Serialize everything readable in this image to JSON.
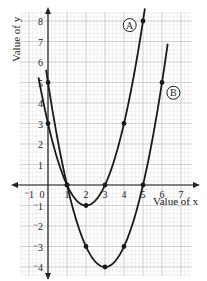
{
  "chart_data": {
    "type": "line",
    "title": "",
    "xlabel": "Value of x",
    "ylabel": "Value of y",
    "xlim": [
      -1.5,
      7.5
    ],
    "ylim": [
      -4.3,
      8.5
    ],
    "grid": true,
    "x_ticks": [
      -1,
      0,
      1,
      2,
      3,
      4,
      5,
      6,
      7
    ],
    "x_tick_labels": [
      "⁻1",
      "0",
      "1",
      "2",
      "3",
      "4",
      "5",
      "6",
      "7"
    ],
    "y_ticks": [
      8,
      7,
      6,
      5,
      4,
      3,
      2,
      1,
      -1,
      -2,
      -3,
      -4
    ],
    "y_tick_labels": [
      "8",
      "7",
      "6",
      "5",
      "4",
      "3",
      "2",
      "1",
      "⁻1",
      "⁻2",
      "⁻3",
      "⁻4"
    ],
    "series": [
      {
        "name": "A",
        "equation": "y = x^2 - 4x + 3",
        "coefficients": [
          1,
          -4,
          3
        ],
        "x_range": [
          -0.5,
          5.1
        ],
        "points": [
          [
            0,
            3
          ],
          [
            1,
            0
          ],
          [
            2,
            -1
          ],
          [
            3,
            0
          ],
          [
            4,
            3
          ],
          [
            5,
            8
          ]
        ],
        "label_pos": [
          4.3,
          7.8
        ]
      },
      {
        "name": "B",
        "equation": "y = x^2 - 6x + 5",
        "coefficients": [
          1,
          -6,
          5
        ],
        "x_range": [
          -0.1,
          6.3
        ],
        "points": [
          [
            0,
            5
          ],
          [
            1,
            0
          ],
          [
            2,
            -3
          ],
          [
            3,
            -4
          ],
          [
            4,
            -3
          ],
          [
            5,
            0
          ],
          [
            6,
            5
          ]
        ],
        "label_pos": [
          6.6,
          4.5
        ]
      }
    ]
  },
  "colors": {
    "grid_minor": "#e3e3e3",
    "grid_major": "#c4c4c4",
    "axis": "#222222",
    "curve": "#1a1a1a"
  }
}
